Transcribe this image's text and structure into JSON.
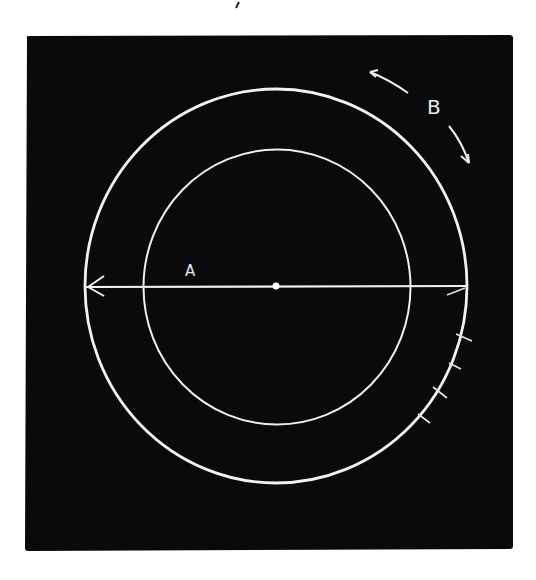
{
  "figure": {
    "background": "#ffffff",
    "panel": {
      "color": "#0a0a0a",
      "x": 25,
      "y": 36,
      "width": 488,
      "height": 514
    },
    "stroke_color": "#f2f2f2",
    "center": {
      "x": 276,
      "y": 286
    },
    "outer_circle": {
      "rx": 192,
      "ry": 197
    },
    "inner_circle": {
      "rx": 134,
      "ry": 137
    },
    "diameter_line": {
      "x1": 86,
      "x2": 467,
      "y": 287
    },
    "tick_marks_count": 4,
    "labels": {
      "a": "A",
      "b": "B"
    }
  }
}
